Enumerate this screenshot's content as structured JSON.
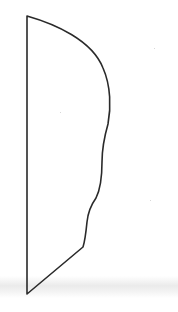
{
  "figure": {
    "stroke_color": "#2a2a2a",
    "background_color": "#ffffff",
    "scan_band_color": "#e8e8e8"
  }
}
